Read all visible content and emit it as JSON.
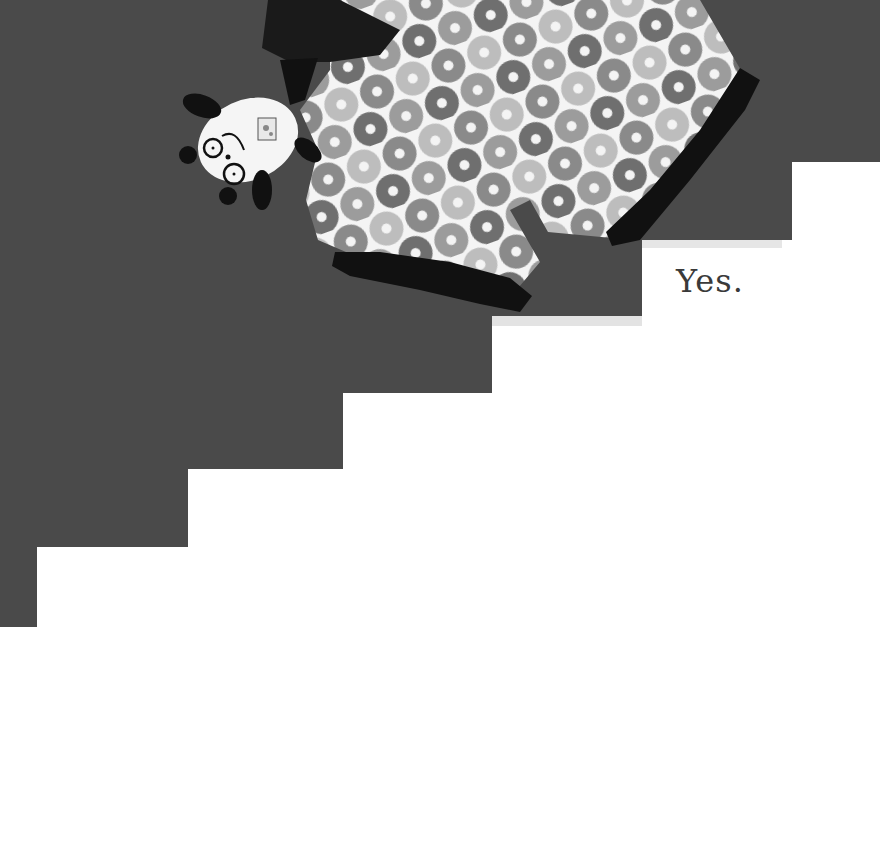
{
  "page": {
    "caption": "Yes.",
    "colors": {
      "wall": "#4a4a4a",
      "background": "#ffffff",
      "ink": "#111111",
      "donut_light": "#bdbdbd",
      "donut_mid": "#8a8a8a",
      "donut_dark": "#6f6f6f"
    }
  },
  "illustration": {
    "subject": "panda plush toy and donut-patterned blanket sliding down a staircase",
    "stairs_steps": 6
  }
}
